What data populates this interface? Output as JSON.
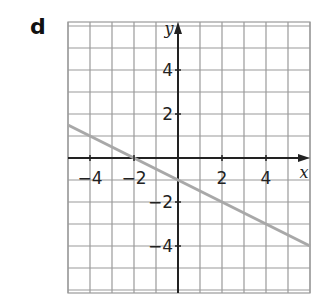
{
  "part_label": "d",
  "graph": {
    "x_axis_label": "x",
    "y_axis_label": "y",
    "x_ticks": [
      {
        "value": -4,
        "label": "−4"
      },
      {
        "value": -2,
        "label": "−2"
      },
      {
        "value": 2,
        "label": "2"
      },
      {
        "value": 4,
        "label": "4"
      }
    ],
    "y_ticks": [
      {
        "value": 4,
        "label": "4"
      },
      {
        "value": 2,
        "label": "2"
      },
      {
        "value": -2,
        "label": "−2"
      },
      {
        "value": -4,
        "label": "−4"
      }
    ],
    "x_range": [
      -5,
      6
    ],
    "y_range": [
      -6.2,
      6.1
    ],
    "grid": true,
    "colors": {
      "grid": "#9a9a9a",
      "axes": "#222222",
      "line": "#a8a8a8",
      "text": "#222222"
    },
    "line": {
      "equation": "y = -0.5x - 1",
      "slope": -0.5,
      "intercept": -1,
      "points": [
        [
          -5,
          1.5
        ],
        [
          -2,
          0
        ],
        [
          0,
          -1
        ],
        [
          2,
          -2
        ],
        [
          4,
          -3
        ],
        [
          6,
          -4
        ]
      ]
    }
  }
}
